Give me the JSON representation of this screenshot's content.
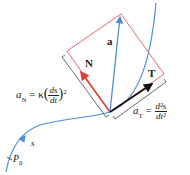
{
  "diagram": {
    "colors": {
      "curve": "#4a90d9",
      "rectangle": "#e06a6a",
      "normal_vector": "#e04040",
      "tangent_vector": "#111111",
      "acceleration_vector": "#4a90d9",
      "bracket": "#444444"
    },
    "labels": {
      "acceleration": "a",
      "normal": "N",
      "tangent": "T",
      "arc_length": "s",
      "start_point": "P",
      "start_point_sub": "0",
      "normal_component_lhs": "a",
      "normal_component_sub": "N",
      "normal_component_eq": "= κ",
      "normal_component_num": "ds",
      "normal_component_den": "dt",
      "normal_component_exp": "2",
      "tangent_component_lhs": "a",
      "tangent_component_sub": "T",
      "tangent_component_eq": "=",
      "tangent_component_num": "d²s",
      "tangent_component_den": "dt²"
    }
  }
}
